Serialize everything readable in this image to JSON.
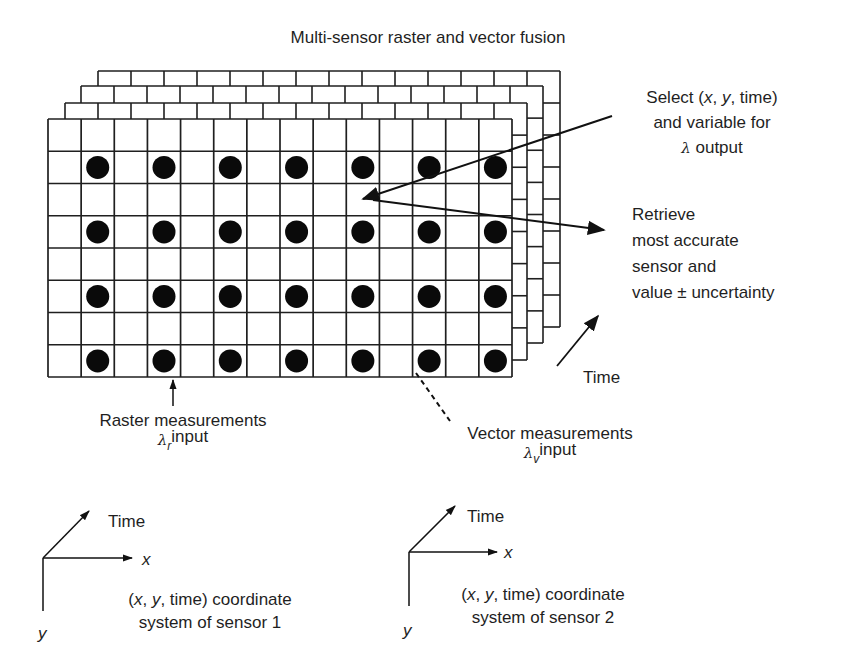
{
  "title": "Multi-sensor raster and vector fusion",
  "grid": {
    "columns": 14,
    "rows": 8,
    "front": {
      "left": 48,
      "top": 119,
      "right": 512,
      "bottom": 377
    },
    "layers": [
      {
        "left": 65,
        "top": 103,
        "right": 527,
        "bottom": 360
      },
      {
        "left": 81,
        "top": 86,
        "right": 543,
        "bottom": 343
      },
      {
        "left": 98,
        "top": 71,
        "right": 560,
        "bottom": 327
      }
    ],
    "dot_rows": [
      1,
      3,
      5,
      7
    ],
    "dot_columns": [
      1,
      3,
      5,
      7,
      9,
      11,
      13
    ],
    "line_color": "#1f1f1f",
    "dot_color": "#0a0a0a"
  },
  "annotations": {
    "select": {
      "line1_pre": "Select (",
      "x": "x",
      "sep1": ", ",
      "y": "y",
      "line1_post": ", time)",
      "line2": "and variable for",
      "lambda": "λ",
      "line3": " output"
    },
    "retrieve": {
      "lines": [
        "Retrieve",
        "most accurate",
        "sensor and",
        "value ± uncertainty"
      ]
    },
    "time_label": "Time",
    "raster": {
      "line1": "Raster measurements",
      "lambda": "λ",
      "subscript": "r",
      "line2": "input"
    },
    "vector": {
      "line1": "Vector measurements",
      "lambda": "λ",
      "subscript": "v",
      "line2": "input"
    }
  },
  "coordinate_systems": [
    {
      "time_label": "Time",
      "x_label": "x",
      "y_label": "y",
      "caption_pre": "(",
      "caption_x": "x",
      "caption_sep": ", ",
      "caption_y": "y",
      "caption_post": ", time) coordinate",
      "caption_line2": "system of sensor 1"
    },
    {
      "time_label": "Time",
      "x_label": "x",
      "y_label": "y",
      "caption_pre": "(",
      "caption_x": "x",
      "caption_sep": ", ",
      "caption_y": "y",
      "caption_post": ", time) coordinate",
      "caption_line2": "system of sensor 2"
    }
  ]
}
